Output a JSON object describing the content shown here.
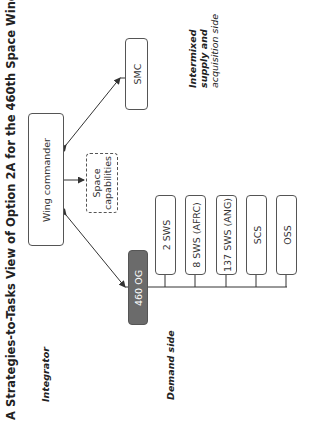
{
  "title": "A Strategies-to-Tasks View of Option 2A for the 460th Space Wing",
  "sides": {
    "integrator": "Integrator",
    "demand": "Demand side",
    "supply": [
      "Intermixed",
      "supply and",
      "acquisition side"
    ]
  },
  "nodes": {
    "wing_commander": "Wing commander",
    "space_capabilities": [
      "Space",
      "capabilities"
    ],
    "smc": "SMC",
    "og": "460 OG",
    "units": [
      "2 SWS",
      "8 SWS (AFRC)",
      "137 SWS (ANG)",
      "SCS",
      "OSS"
    ]
  },
  "colors": {
    "og_fill": "#6b6b6b",
    "line": "#333333"
  }
}
